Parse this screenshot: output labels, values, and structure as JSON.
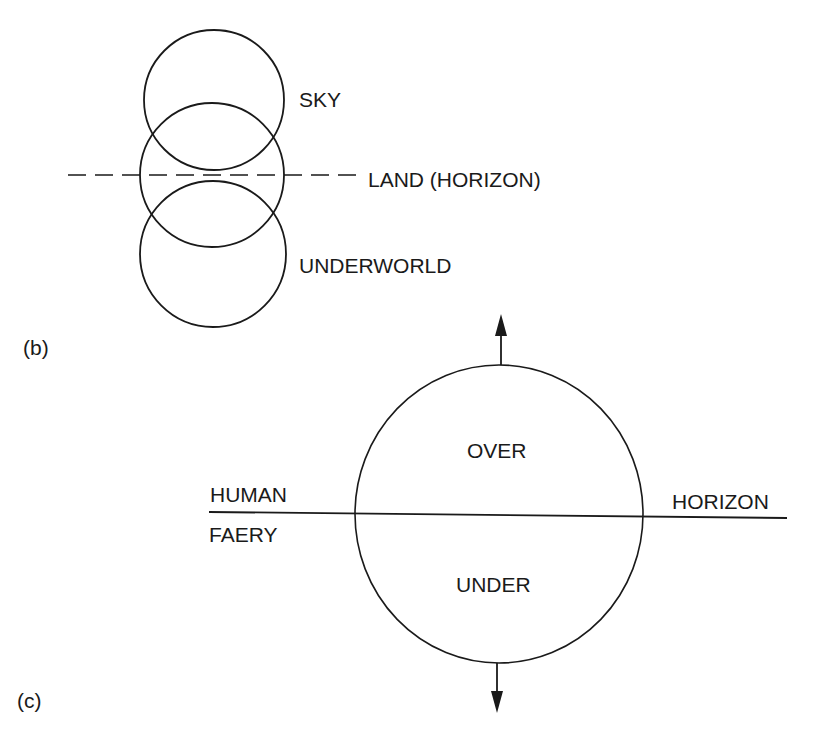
{
  "colors": {
    "ink": "#1a1a1a",
    "background": "#ffffff"
  },
  "panels": {
    "b": {
      "label": "(b)",
      "circles": [
        {
          "name": "sky-circle",
          "cx": 214,
          "cy": 100,
          "r": 70
        },
        {
          "name": "land-circle",
          "cx": 212,
          "cy": 175,
          "r": 72
        },
        {
          "name": "underworld-circle",
          "cx": 213,
          "cy": 254,
          "r": 73
        }
      ],
      "dashed_line": {
        "x1": 68,
        "y1": 175,
        "x2": 356,
        "y2": 175
      },
      "labels": {
        "sky": "SKY",
        "land": "LAND (HORIZON)",
        "underworld": "UNDERWORLD"
      }
    },
    "c": {
      "label": "(c)",
      "circle": {
        "cx": 499,
        "cy": 514,
        "r": 146
      },
      "horizon_line": {
        "x1": 209,
        "y1": 512,
        "x2": 787,
        "y2": 518
      },
      "arrow_up": {
        "x": 501,
        "y_start": 365,
        "y_tip": 314
      },
      "arrow_down": {
        "x": 497,
        "y_start": 663,
        "y_tip": 713
      },
      "labels": {
        "over": "OVER",
        "under": "UNDER",
        "human": "HUMAN",
        "faery": "FAERY",
        "horizon": "HORIZON"
      }
    }
  }
}
